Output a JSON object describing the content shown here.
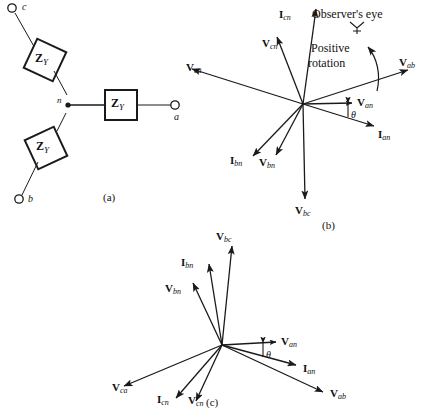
{
  "figure": {
    "panels": [
      {
        "id": "a",
        "caption": "(a)",
        "type": "circuit-wye-connected-load",
        "terminals": [
          {
            "name": "c",
            "label": "c",
            "x": 18,
            "y": 8
          },
          {
            "name": "a",
            "label": "a",
            "x": 175,
            "y": 108
          },
          {
            "name": "b",
            "label": "b",
            "x": 16,
            "y": 197
          }
        ],
        "neutral": {
          "label": "n",
          "x": 58,
          "y": 105
        },
        "impedances": [
          {
            "name": "impedance-c",
            "label": "Z",
            "sub": "Y",
            "shape": "diamond",
            "cx": 45,
            "cy": 60
          },
          {
            "name": "impedance-a",
            "label": "Z",
            "sub": "Y",
            "shape": "rect",
            "cx": 120,
            "cy": 105
          },
          {
            "name": "impedance-b",
            "label": "Z",
            "sub": "Y",
            "shape": "diamond",
            "cx": 46,
            "cy": 148
          }
        ]
      },
      {
        "id": "b",
        "caption": "(b)",
        "type": "phasor-diagram-abc-sequence",
        "origin": {
          "x": 303,
          "y": 104
        },
        "notes": [
          {
            "name": "observers-eye-note",
            "text": "Observer's eye",
            "x": 312,
            "y": 8
          },
          {
            "name": "positive-rotation-note",
            "line1": "Positive",
            "line2": "rotation",
            "x": 311,
            "y": 42
          }
        ],
        "angle_symbol": {
          "name": "theta-angle-b",
          "text": "θ",
          "x": 349,
          "y": 111
        },
        "vectors": [
          {
            "name": "vector-Icn",
            "label": "I",
            "sub": "cn",
            "angle_deg": 82,
            "length": 96,
            "label_x": 279,
            "label_y": 9
          },
          {
            "name": "vector-Vcn",
            "label": "V",
            "sub": "cn",
            "angle_deg": 69,
            "length": 72,
            "label_x": 264,
            "label_y": 38
          },
          {
            "name": "vector-Vca",
            "label": "V",
            "sub": "ca",
            "angle_deg": 172,
            "length": 112,
            "label_x": 186,
            "label_y": 62
          },
          {
            "name": "vector-Vab",
            "label": "V",
            "sub": "ab",
            "angle_deg": 18,
            "length": 110,
            "label_x": 400,
            "label_y": 58
          },
          {
            "name": "vector-Van",
            "label": "V",
            "sub": "an",
            "angle_deg": 1,
            "length": 49,
            "label_x": 358,
            "label_y": 99
          },
          {
            "name": "vector-Ian",
            "label": "I",
            "sub": "an",
            "angle_deg": -17,
            "length": 74,
            "label_x": 367,
            "label_y": 133
          },
          {
            "name": "vector-Ibn",
            "label": "I",
            "sub": "bn",
            "angle_deg": -134,
            "length": 72,
            "label_x": 228,
            "label_y": 150
          },
          {
            "name": "vector-Vbn",
            "label": "V",
            "sub": "bn",
            "angle_deg": -118,
            "length": 58,
            "label_x": 259,
            "label_y": 152
          },
          {
            "name": "vector-Vbc",
            "label": "V",
            "sub": "bc",
            "angle_deg": -89,
            "length": 98,
            "label_x": 295,
            "label_y": 207
          }
        ]
      },
      {
        "id": "c",
        "caption": "(c)",
        "type": "phasor-diagram-acb-sequence",
        "origin": {
          "x": 222,
          "y": 345
        },
        "angle_symbol": {
          "name": "theta-angle-c",
          "text": "θ",
          "x": 265,
          "y": 351
        },
        "vectors": [
          {
            "name": "vector-Vbc",
            "label": "V",
            "sub": "bc",
            "angle_deg": 84,
            "length": 100,
            "label_x": 216,
            "label_y": 232
          },
          {
            "name": "vector-Ibn",
            "label": "I",
            "sub": "bn",
            "angle_deg": 99,
            "length": 82,
            "label_x": 181,
            "label_y": 258
          },
          {
            "name": "vector-Vbn",
            "label": "V",
            "sub": "bn",
            "angle_deg": 115,
            "length": 68,
            "label_x": 167,
            "label_y": 284
          },
          {
            "name": "vector-Van",
            "label": "V",
            "sub": "an",
            "angle_deg": -3,
            "length": 54,
            "label_x": 281,
            "label_y": 338
          },
          {
            "name": "vector-Ian",
            "label": "I",
            "sub": "an",
            "angle_deg": -15,
            "length": 76,
            "label_x": 305,
            "label_y": 366
          },
          {
            "name": "vector-Vab",
            "label": "V",
            "sub": "ab",
            "angle_deg": -25,
            "length": 112,
            "label_x": 331,
            "label_y": 388
          },
          {
            "name": "vector-Vca",
            "label": "V",
            "sub": "ca",
            "angle_deg": -157,
            "length": 106,
            "label_x": 112,
            "label_y": 382
          },
          {
            "name": "vector-Icn",
            "label": "I",
            "sub": "cn",
            "angle_deg": -131,
            "length": 70,
            "label_x": 158,
            "label_y": 392
          },
          {
            "name": "vector-Vcn",
            "label": "V",
            "sub": "cn",
            "angle_deg": -115,
            "length": 62,
            "label_x": 189,
            "label_y": 392
          }
        ]
      }
    ]
  },
  "style": {
    "stroke_color": "#1a1a1a",
    "text_color": "#111111",
    "background": "#ffffff"
  }
}
